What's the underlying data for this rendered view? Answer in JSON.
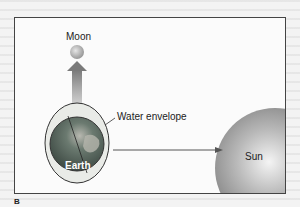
{
  "diagram": {
    "topic": "Tidal bulge of Earth's water envelope",
    "labels": {
      "moon": "Moon",
      "water_envelope": "Water envelope",
      "earth": "Earth",
      "sun": "Sun"
    },
    "figure_label": "B",
    "arrows": [
      {
        "from": "Earth",
        "to": "Moon",
        "style": "wide gradient arrow"
      },
      {
        "from": "Earth",
        "to": "Sun",
        "style": "thin line arrow"
      }
    ],
    "colors": {
      "earth": "#4a5a52",
      "envelope": "#e6e8e4",
      "sun": "#9a9a9a",
      "moon": "#bdbdbd",
      "frame": "#444444"
    }
  }
}
